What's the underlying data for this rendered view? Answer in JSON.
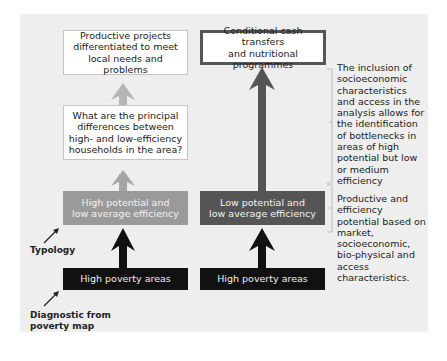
{
  "diagram": {
    "left_column": {
      "top_box": "Productive projects differentiated to meet local needs and problems",
      "question_box": "What are the principal differences between high- and low-efficiency households in the area?",
      "typology_box": [
        "High potential and",
        "low average efficiency"
      ],
      "poverty_box": "High poverty areas"
    },
    "right_column": {
      "top_box": [
        "Conditional cash transfers",
        "and nutritional programmes"
      ],
      "typology_box": [
        "Low potential and",
        "low average efficiency"
      ],
      "poverty_box": "High poverty areas"
    },
    "annotations": {
      "upper": "The inclusion of socioeconomic characteristics and access in the analysis allows for the identification of bottlenecks in areas of high potential but low or medium efficiency",
      "lower": "Productive and efficiency potential based on market, socioeconomic, bio-physical and access characteristics."
    },
    "labels": {
      "typology": "Typology",
      "diagnostic": [
        "Diagnostic from",
        "poverty map"
      ]
    },
    "colors": {
      "panel": "#eeeeee",
      "light_gray": "#9a9a9a",
      "pale_arrow": "#b0b0b0",
      "dark_gray": "#555555",
      "black": "#111111"
    }
  }
}
